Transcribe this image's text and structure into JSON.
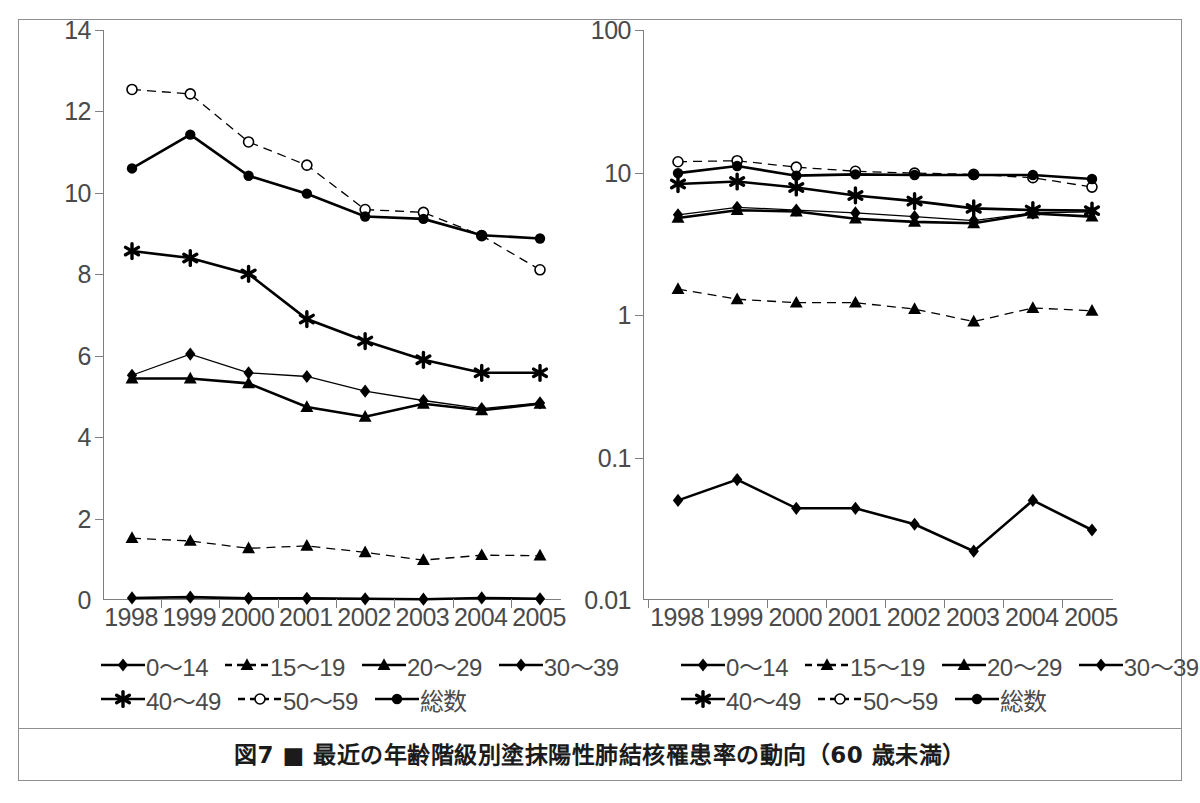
{
  "figure": {
    "caption": "図7 ■ 最近の年齢階級別塗抹陽性肺結核罹患率の動向（60 歳未満）"
  },
  "chart_data": [
    {
      "type": "line",
      "panel": "left",
      "title": "",
      "xlabel": "",
      "ylabel": "",
      "scale": "linear",
      "ylim": [
        0,
        14
      ],
      "yticks": [
        "0",
        "2",
        "4",
        "6",
        "8",
        "10",
        "12",
        "14"
      ],
      "ytick_values": [
        0,
        2,
        4,
        6,
        8,
        10,
        12,
        14
      ],
      "grid": false,
      "legend_position": "below",
      "categories": [
        "1998",
        "1999",
        "2000",
        "2001",
        "2002",
        "2003",
        "2004",
        "2005"
      ],
      "series": [
        {
          "name": "0〜14",
          "marker": "diamond",
          "line": "solid",
          "width": "thick",
          "values": [
            0.05,
            0.07,
            0.04,
            0.04,
            0.03,
            0.02,
            0.05,
            0.03
          ]
        },
        {
          "name": "15〜19",
          "marker": "triangle",
          "line": "dashed",
          "width": "thin",
          "values": [
            1.52,
            1.45,
            1.27,
            1.33,
            1.17,
            0.98,
            1.1,
            1.09
          ]
        },
        {
          "name": "20〜29",
          "marker": "triangle",
          "line": "solid",
          "width": "thick",
          "values": [
            5.44,
            5.44,
            5.32,
            4.74,
            4.5,
            4.82,
            4.66,
            4.82
          ]
        },
        {
          "name": "30〜39",
          "marker": "diamond",
          "line": "solid",
          "width": "thin",
          "values": [
            5.52,
            6.04,
            5.58,
            5.49,
            5.13,
            4.9,
            4.7,
            4.84
          ]
        },
        {
          "name": "40〜49",
          "marker": "asterisk",
          "line": "solid",
          "width": "thick",
          "values": [
            8.57,
            8.4,
            8.01,
            6.9,
            6.36,
            5.9,
            5.58,
            5.58
          ]
        },
        {
          "name": "50〜59",
          "marker": "open-circle",
          "line": "dashed",
          "width": "thin",
          "values": [
            12.54,
            12.43,
            11.25,
            10.68,
            9.59,
            9.52,
            8.95,
            8.11
          ]
        },
        {
          "name": "総数",
          "marker": "filled-circle",
          "line": "solid",
          "width": "thick",
          "values": [
            10.6,
            11.43,
            10.42,
            9.98,
            9.42,
            9.36,
            8.96,
            8.88
          ]
        }
      ]
    },
    {
      "type": "line",
      "panel": "right",
      "title": "",
      "xlabel": "",
      "ylabel": "",
      "scale": "log",
      "ylim": [
        0.01,
        100
      ],
      "yticks": [
        "100",
        "10",
        "1",
        "0.1",
        "0.01"
      ],
      "ytick_values": [
        100,
        10,
        1,
        0.1,
        0.01
      ],
      "grid": false,
      "legend_position": "below",
      "categories": [
        "1998",
        "1999",
        "2000",
        "2001",
        "2002",
        "2003",
        "2004",
        "2005"
      ],
      "series": [
        {
          "name": "0〜14",
          "marker": "diamond",
          "line": "solid",
          "width": "thick",
          "values": [
            0.05,
            0.07,
            0.044,
            0.044,
            0.034,
            0.022,
            0.05,
            0.031
          ]
        },
        {
          "name": "15〜19",
          "marker": "triangle",
          "line": "dashed",
          "width": "thin",
          "values": [
            1.52,
            1.29,
            1.22,
            1.22,
            1.1,
            0.9,
            1.12,
            1.07
          ]
        },
        {
          "name": "20〜29",
          "marker": "triangle",
          "line": "solid",
          "width": "thick",
          "values": [
            4.8,
            5.44,
            5.32,
            4.74,
            4.5,
            4.4,
            5.15,
            4.9
          ]
        },
        {
          "name": "30〜39",
          "marker": "diamond",
          "line": "solid",
          "width": "thin",
          "values": [
            5.05,
            5.7,
            5.45,
            5.2,
            4.9,
            4.6,
            5.2,
            5.3
          ]
        },
        {
          "name": "40〜49",
          "marker": "asterisk",
          "line": "solid",
          "width": "thick",
          "values": [
            8.3,
            8.65,
            7.85,
            6.9,
            6.3,
            5.6,
            5.45,
            5.4
          ]
        },
        {
          "name": "50〜59",
          "marker": "open-circle",
          "line": "dashed",
          "width": "thin",
          "values": [
            11.9,
            12.1,
            10.9,
            10.2,
            9.9,
            9.7,
            9.2,
            7.9
          ]
        },
        {
          "name": "総数",
          "marker": "filled-circle",
          "line": "solid",
          "width": "thick",
          "values": [
            9.9,
            11.1,
            9.5,
            9.7,
            9.6,
            9.6,
            9.6,
            9.0
          ]
        }
      ]
    }
  ],
  "legend": {
    "rows": [
      [
        {
          "label": "0〜14",
          "marker": "diamond",
          "line": "solid"
        },
        {
          "label": "15〜19",
          "marker": "triangle",
          "line": "dashed"
        },
        {
          "label": "20〜29",
          "marker": "triangle",
          "line": "solid"
        },
        {
          "label": "30〜39",
          "marker": "diamond",
          "line": "solid"
        }
      ],
      [
        {
          "label": "40〜49",
          "marker": "asterisk",
          "line": "solid"
        },
        {
          "label": "50〜59",
          "marker": "open-circle",
          "line": "dashed"
        },
        {
          "label": "総数",
          "marker": "filled-circle",
          "line": "solid"
        }
      ]
    ]
  },
  "colors": {
    "ink": "#000000",
    "axis": "#7d7f82",
    "tick_text": "#4a4a4a",
    "frame": "#8d8f92",
    "background": "#ffffff"
  }
}
